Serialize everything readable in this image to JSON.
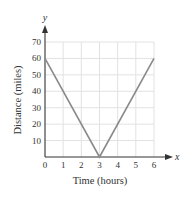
{
  "chart_data": {
    "type": "line",
    "title": "",
    "xlabel": "Time (hours)",
    "ylabel": "Distance (miles)",
    "x_axis_var": "x",
    "y_axis_var": "y",
    "x": [
      0,
      3,
      6
    ],
    "series": [
      {
        "name": "distance",
        "values": [
          60,
          0,
          60
        ]
      }
    ],
    "xlim": [
      0,
      6
    ],
    "ylim": [
      0,
      70
    ],
    "xticks": [
      0,
      1,
      2,
      3,
      4,
      5,
      6
    ],
    "yticks": [
      10,
      20,
      30,
      40,
      50,
      60,
      70
    ],
    "x_tick_labels": [
      "0",
      "1",
      "2",
      "3",
      "4",
      "5",
      "6"
    ],
    "y_tick_labels": [
      "10",
      "20",
      "30",
      "40",
      "50",
      "60",
      "70"
    ],
    "grid": true,
    "legend": null
  },
  "colors": {
    "line": "#8a8a8a",
    "grid": "#e2e2e2",
    "axis": "#333333"
  }
}
